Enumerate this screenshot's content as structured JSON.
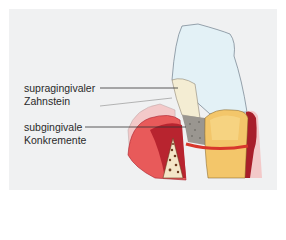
{
  "labels": {
    "supragingival_line1": "supragingivaler",
    "supragingival_line2": "Zahnstein",
    "subgingival_line1": "subgingivale",
    "subgingival_line2": "Konkremente"
  },
  "colors": {
    "background": "#f0f1f2",
    "enamel": "#e3f1f6",
    "calculus": "#f4edd3",
    "gingiva": "#e35b5b",
    "gingiva_dark": "#a81e2a",
    "root": "#f3c66a",
    "band": "#d8372c"
  }
}
